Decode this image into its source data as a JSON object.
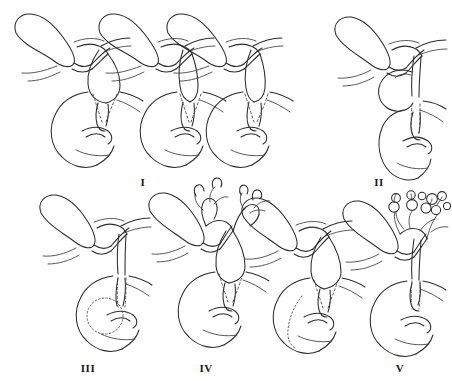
{
  "figure": {
    "background_color": "#ffffff",
    "stroke_color": "#2b2b2b",
    "width": 452,
    "height": 381,
    "style": "hand-drawn medical line illustration",
    "rows": 2,
    "drawing_count": 8
  },
  "panels": [
    {
      "id": "panel-1",
      "label": "I",
      "label_x": 143,
      "label_y": 176,
      "row": 1,
      "drawings": 3,
      "description": "Type I — fusiform / cystic dilatation of the common bile duct",
      "anatomy": [
        "gallbladder",
        "cystic duct",
        "hepatic ducts",
        "common bile duct cyst",
        "duodenum",
        "pancreatic duct"
      ],
      "features": [
        "fusiform extrahepatic duct dilatation",
        "dashed intramural duct segment"
      ]
    },
    {
      "id": "panel-2",
      "label": "II",
      "label_x": 379,
      "label_y": 176,
      "row": 1,
      "drawings": 1,
      "description": "Type II — true diverticulum of the extrahepatic bile duct",
      "anatomy": [
        "gallbladder",
        "diverticular cyst",
        "common bile duct",
        "duodenum"
      ],
      "features": [
        "round saccular diverticulum arising from the duct",
        "normal caliber common duct"
      ]
    },
    {
      "id": "panel-3",
      "label": "III",
      "label_x": 88,
      "label_y": 364,
      "row": 2,
      "drawings": 1,
      "description": "Type III — choledochocele of the intraduodenal duct",
      "anatomy": [
        "gallbladder",
        "common bile duct",
        "intraduodenal cyst",
        "duodenum"
      ],
      "features": [
        "dotted circular cyst bulging inside the duodenal lumen",
        "non-dilated proximal duct"
      ]
    },
    {
      "id": "panel-4",
      "label": "IV",
      "label_x": 206,
      "label_y": 364,
      "row": 2,
      "drawings": 2,
      "description": "Type IV — multiple cysts: IVa intra- and extrahepatic, IVb multiple extrahepatic",
      "anatomy": [
        "gallbladder",
        "dilated intrahepatic ducts",
        "extrahepatic cyst",
        "duodenum"
      ],
      "features": [
        "branching dilated intrahepatic radicles (IVa)",
        "multiple extrahepatic dilatations (IVb)"
      ]
    },
    {
      "id": "panel-5",
      "label": "V",
      "label_x": 400,
      "label_y": 364,
      "row": 2,
      "drawings": 1,
      "description": "Type V — Caroli disease, multiple intrahepatic cystic dilatations",
      "anatomy": [
        "gallbladder",
        "multiple intrahepatic cysts",
        "common bile duct",
        "duodenum"
      ],
      "features": [
        "clustered saccular cysts on intrahepatic branches",
        "non-dilated extrahepatic duct"
      ]
    }
  ]
}
